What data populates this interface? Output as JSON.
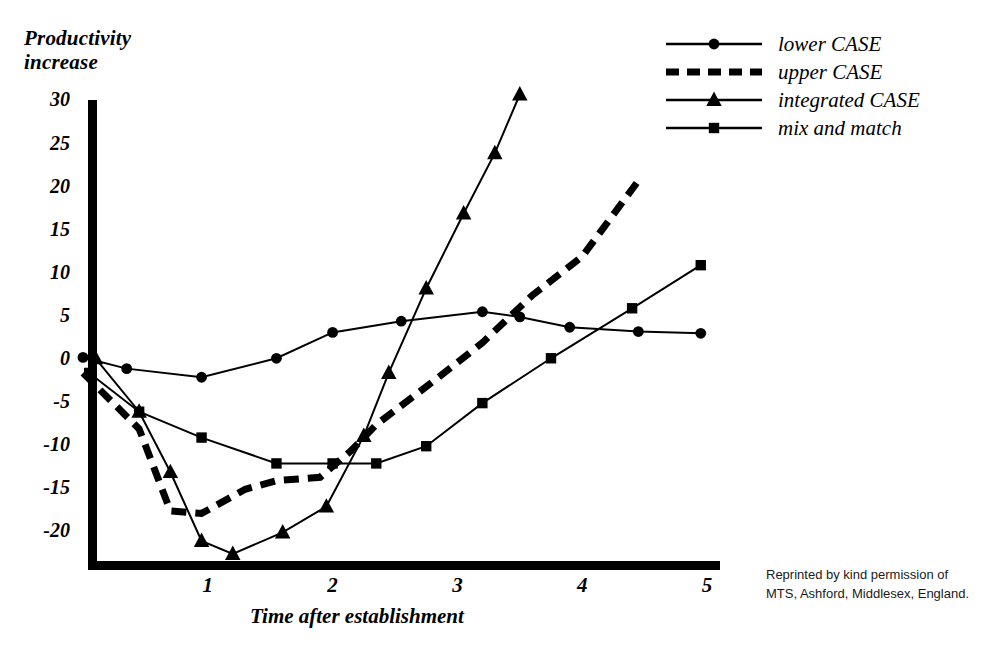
{
  "chart_data": {
    "type": "line",
    "title": "",
    "xlabel": "Time after establishment",
    "ylabel": "Productivity\nincrease",
    "xlim": [
      0,
      5.15
    ],
    "ylim": [
      -24,
      32
    ],
    "xticks": [
      1,
      2,
      3,
      4,
      5
    ],
    "yticks": [
      30,
      25,
      20,
      15,
      10,
      5,
      0,
      -5,
      -10,
      -15,
      -20
    ],
    "grid": false,
    "legend_position": "top-right",
    "series": [
      {
        "name": "lower CASE",
        "marker": "circle",
        "line_style": "solid",
        "line_width": 2,
        "color": "#000000",
        "points": [
          [
            0.0,
            0.3
          ],
          [
            0.35,
            -1.0
          ],
          [
            0.95,
            -2.0
          ],
          [
            1.55,
            0.2
          ],
          [
            2.0,
            3.2
          ],
          [
            2.55,
            4.5
          ],
          [
            3.2,
            5.6
          ],
          [
            3.5,
            5.0
          ],
          [
            3.9,
            3.8
          ],
          [
            4.45,
            3.3
          ],
          [
            4.95,
            3.1
          ]
        ]
      },
      {
        "name": "upper CASE",
        "marker": "none",
        "line_style": "dashed",
        "line_width": 7,
        "color": "#000000",
        "points": [
          [
            0.0,
            -1.5
          ],
          [
            0.45,
            -8.0
          ],
          [
            0.7,
            -17.5
          ],
          [
            0.95,
            -17.8
          ],
          [
            1.3,
            -15.0
          ],
          [
            1.55,
            -14.0
          ],
          [
            1.9,
            -13.6
          ],
          [
            2.15,
            -10.5
          ],
          [
            2.35,
            -7.5
          ],
          [
            2.85,
            -2.0
          ],
          [
            3.2,
            2.0
          ],
          [
            3.6,
            7.5
          ],
          [
            4.0,
            12.0
          ],
          [
            4.45,
            20.8
          ]
        ]
      },
      {
        "name": "integrated CASE",
        "marker": "triangle",
        "line_style": "solid",
        "line_width": 2,
        "color": "#000000",
        "points": [
          [
            0.1,
            0.2
          ],
          [
            0.45,
            -6.0
          ],
          [
            0.7,
            -13.0
          ],
          [
            0.95,
            -21.0
          ],
          [
            1.2,
            -22.5
          ],
          [
            1.6,
            -20.0
          ],
          [
            1.95,
            -17.0
          ],
          [
            2.25,
            -8.8
          ],
          [
            2.45,
            -1.5
          ],
          [
            2.75,
            8.3
          ],
          [
            3.05,
            17.0
          ],
          [
            3.3,
            24.0
          ],
          [
            3.5,
            30.8
          ]
        ]
      },
      {
        "name": "mix and match",
        "marker": "square",
        "line_style": "solid",
        "line_width": 2,
        "color": "#000000",
        "points": [
          [
            0.05,
            -1.5
          ],
          [
            0.45,
            -6.0
          ],
          [
            0.95,
            -9.0
          ],
          [
            1.55,
            -12.0
          ],
          [
            2.0,
            -12.0
          ],
          [
            2.35,
            -12.0
          ],
          [
            2.75,
            -10.0
          ],
          [
            3.2,
            -5.0
          ],
          [
            3.75,
            0.2
          ],
          [
            4.4,
            6.0
          ],
          [
            4.95,
            11.0
          ]
        ]
      }
    ]
  },
  "legend": {
    "items": [
      {
        "label": "lower CASE",
        "marker": "circle",
        "style": "solid"
      },
      {
        "label": "upper CASE",
        "marker": "none",
        "style": "dashed"
      },
      {
        "label": "integrated CASE",
        "marker": "triangle",
        "style": "solid"
      },
      {
        "label": "mix and match",
        "marker": "square",
        "style": "solid"
      }
    ]
  },
  "credit": "Reprinted by kind permission of MTS, Ashford, Middlesex, England.",
  "axes": {
    "y_title": "Productivity\nincrease",
    "x_title": "Time after establishment",
    "ytick_labels": [
      "30",
      "25",
      "20",
      "15",
      "10",
      "5",
      "0",
      "-5",
      "-10",
      "-15",
      "-20"
    ],
    "xtick_labels": [
      "1",
      "2",
      "3",
      "4",
      "5"
    ],
    "axis_color": "#000000"
  }
}
